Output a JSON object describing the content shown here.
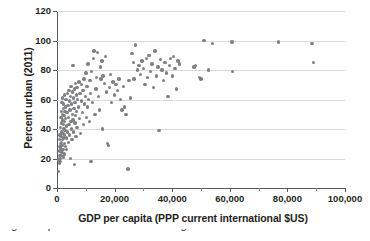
{
  "chart_data": {
    "type": "scatter",
    "title": "",
    "xlabel": "GDP per capita (PPP current international $US)",
    "ylabel": "Percent urban (2011)",
    "xlim": [
      0,
      100000
    ],
    "ylim": [
      0,
      120
    ],
    "grid": true,
    "grid_axis": "y",
    "legend": null,
    "marker_color": "#7f8082",
    "xticks": [
      0,
      20000,
      40000,
      60000,
      80000,
      100000
    ],
    "xtick_labels": [
      "0",
      "20,000",
      "40,000",
      "60,000",
      "80,000",
      "100,000"
    ],
    "xminor_ticks": [
      10000,
      30000,
      50000,
      70000,
      90000
    ],
    "yticks": [
      0,
      20,
      40,
      60,
      80,
      100,
      120
    ],
    "ytick_labels": [
      "0",
      "20",
      "40",
      "60",
      "80",
      "100",
      "120"
    ],
    "points": [
      [
        600,
        11
      ],
      [
        700,
        19
      ],
      [
        800,
        22
      ],
      [
        850,
        17
      ],
      [
        900,
        28
      ],
      [
        950,
        33
      ],
      [
        1000,
        25
      ],
      [
        1050,
        20
      ],
      [
        1100,
        36
      ],
      [
        1150,
        30
      ],
      [
        1200,
        18
      ],
      [
        1250,
        41
      ],
      [
        1300,
        27
      ],
      [
        1350,
        48
      ],
      [
        1400,
        35
      ],
      [
        1450,
        22
      ],
      [
        1500,
        52
      ],
      [
        1550,
        31
      ],
      [
        1600,
        44
      ],
      [
        1650,
        38
      ],
      [
        1700,
        24
      ],
      [
        1750,
        58
      ],
      [
        1800,
        29
      ],
      [
        1850,
        50
      ],
      [
        1900,
        33
      ],
      [
        1950,
        46
      ],
      [
        2000,
        61
      ],
      [
        2050,
        37
      ],
      [
        2100,
        26
      ],
      [
        2150,
        54
      ],
      [
        2200,
        43
      ],
      [
        2250,
        34
      ],
      [
        2300,
        21
      ],
      [
        2350,
        57
      ],
      [
        2400,
        40
      ],
      [
        2450,
        49
      ],
      [
        2500,
        30
      ],
      [
        2550,
        63
      ],
      [
        2600,
        36
      ],
      [
        2650,
        45
      ],
      [
        2700,
        23
      ],
      [
        2750,
        52
      ],
      [
        2800,
        39
      ],
      [
        2900,
        55
      ],
      [
        2950,
        28
      ],
      [
        3000,
        47
      ],
      [
        3100,
        60
      ],
      [
        3200,
        34
      ],
      [
        3300,
        42
      ],
      [
        3400,
        26
      ],
      [
        3500,
        51
      ],
      [
        3600,
        64
      ],
      [
        3700,
        38
      ],
      [
        3800,
        56
      ],
      [
        3900,
        31
      ],
      [
        4000,
        48
      ],
      [
        4100,
        66
      ],
      [
        4200,
        43
      ],
      [
        4300,
        59
      ],
      [
        4400,
        36
      ],
      [
        4500,
        53
      ],
      [
        4600,
        20
      ],
      [
        4700,
        62
      ],
      [
        4800,
        45
      ],
      [
        4900,
        69
      ],
      [
        5000,
        40
      ],
      [
        5100,
        57
      ],
      [
        5200,
        33
      ],
      [
        5300,
        65
      ],
      [
        5400,
        50
      ],
      [
        5500,
        83
      ],
      [
        5600,
        46
      ],
      [
        5700,
        61
      ],
      [
        5800,
        38
      ],
      [
        5900,
        54
      ],
      [
        6000,
        67
      ],
      [
        6100,
        16
      ],
      [
        6200,
        44
      ],
      [
        6300,
        58
      ],
      [
        6400,
        71
      ],
      [
        6500,
        49
      ],
      [
        6600,
        35
      ],
      [
        6700,
        63
      ],
      [
        6800,
        52
      ],
      [
        6900,
        68
      ],
      [
        7000,
        41
      ],
      [
        7200,
        60
      ],
      [
        7400,
        55
      ],
      [
        7600,
        72
      ],
      [
        7800,
        47
      ],
      [
        8000,
        64
      ],
      [
        8200,
        37
      ],
      [
        8400,
        59
      ],
      [
        8600,
        70
      ],
      [
        8800,
        51
      ],
      [
        9000,
        66
      ],
      [
        9200,
        43
      ],
      [
        9400,
        74
      ],
      [
        9600,
        57
      ],
      [
        9800,
        62
      ],
      [
        10000,
        78
      ],
      [
        10200,
        48
      ],
      [
        10400,
        69
      ],
      [
        10600,
        55
      ],
      [
        10800,
        84
      ],
      [
        11000,
        60
      ],
      [
        11200,
        45
      ],
      [
        11400,
        73
      ],
      [
        11600,
        64
      ],
      [
        11800,
        18
      ],
      [
        12000,
        79
      ],
      [
        12300,
        58
      ],
      [
        12600,
        88
      ],
      [
        12900,
        93
      ],
      [
        13200,
        50
      ],
      [
        13500,
        67
      ],
      [
        13800,
        75
      ],
      [
        14100,
        92
      ],
      [
        14400,
        62
      ],
      [
        14700,
        53
      ],
      [
        15000,
        82
      ],
      [
        15300,
        74
      ],
      [
        15600,
        86
      ],
      [
        15800,
        40
      ],
      [
        16000,
        76
      ],
      [
        16400,
        71
      ],
      [
        16800,
        89
      ],
      [
        17200,
        65
      ],
      [
        17500,
        30
      ],
      [
        17800,
        29
      ],
      [
        18200,
        68
      ],
      [
        18600,
        77
      ],
      [
        19000,
        58
      ],
      [
        19500,
        72
      ],
      [
        20000,
        63
      ],
      [
        20500,
        70
      ],
      [
        21000,
        66
      ],
      [
        21500,
        74
      ],
      [
        22000,
        60
      ],
      [
        22500,
        53
      ],
      [
        23000,
        69
      ],
      [
        23500,
        55
      ],
      [
        24000,
        50
      ],
      [
        24600,
        13
      ],
      [
        25000,
        73
      ],
      [
        25500,
        61
      ],
      [
        26000,
        91
      ],
      [
        26500,
        85
      ],
      [
        26800,
        74
      ],
      [
        27200,
        97
      ],
      [
        28000,
        80
      ],
      [
        28500,
        83
      ],
      [
        29000,
        77
      ],
      [
        29500,
        86
      ],
      [
        30000,
        81
      ],
      [
        30500,
        70
      ],
      [
        31000,
        88
      ],
      [
        31500,
        75
      ],
      [
        32000,
        90
      ],
      [
        32500,
        79
      ],
      [
        33000,
        84
      ],
      [
        33500,
        68
      ],
      [
        34000,
        93
      ],
      [
        34500,
        76
      ],
      [
        35000,
        82
      ],
      [
        35400,
        39
      ],
      [
        36000,
        87
      ],
      [
        36500,
        80
      ],
      [
        37000,
        73
      ],
      [
        37500,
        85
      ],
      [
        38000,
        78
      ],
      [
        38500,
        62
      ],
      [
        39000,
        83
      ],
      [
        39500,
        88
      ],
      [
        40000,
        76
      ],
      [
        40500,
        89
      ],
      [
        41000,
        81
      ],
      [
        41500,
        67
      ],
      [
        42000,
        86
      ],
      [
        42500,
        84
      ],
      [
        47500,
        82
      ],
      [
        48000,
        83
      ],
      [
        49500,
        75
      ],
      [
        50000,
        74
      ],
      [
        51000,
        100
      ],
      [
        52500,
        80
      ],
      [
        54000,
        98
      ],
      [
        60800,
        99
      ],
      [
        61000,
        79
      ],
      [
        77000,
        99
      ],
      [
        88500,
        98
      ],
      [
        89000,
        85
      ]
    ]
  },
  "axes": {
    "y_title": "Percent urban (2011)",
    "x_title": "GDP per capita (PPP current international $US)"
  },
  "caption_sliver": "Figure caption text clipped at bottom edge"
}
